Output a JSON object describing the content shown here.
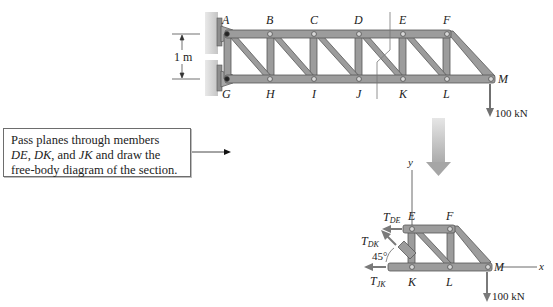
{
  "figure": {
    "top_truss": {
      "dimension_label": "1 m",
      "top_nodes": [
        "A",
        "B",
        "C",
        "D",
        "E",
        "F"
      ],
      "bottom_nodes": [
        "G",
        "H",
        "I",
        "J",
        "K",
        "L"
      ],
      "tip_node": "M",
      "load_label": "100 kN"
    },
    "instruction": {
      "line1": "Pass planes through members",
      "line2_parts": [
        "DE",
        ", ",
        "DK",
        ", and ",
        "JK",
        " and draw the"
      ],
      "line3": "free-body diagram of the section."
    },
    "section_fbd": {
      "axis_y": "y",
      "axis_x": "x",
      "top_nodes": [
        "E",
        "F"
      ],
      "bottom_nodes": [
        "K",
        "L"
      ],
      "tip_node": "M",
      "force_DE": {
        "T": "T",
        "sub": "DE"
      },
      "force_DK": {
        "T": "T",
        "sub": "DK"
      },
      "force_JK": {
        "T": "T",
        "sub": "JK"
      },
      "angle_label": "45°",
      "load_label": "100 kN"
    },
    "colors": {
      "member_fill": "#9a9a9a",
      "member_edge": "#5a5a5a",
      "wall": "#cfcfcf",
      "arrow": "#7a7a7a",
      "big_arrow": "#b5b5b5"
    }
  }
}
